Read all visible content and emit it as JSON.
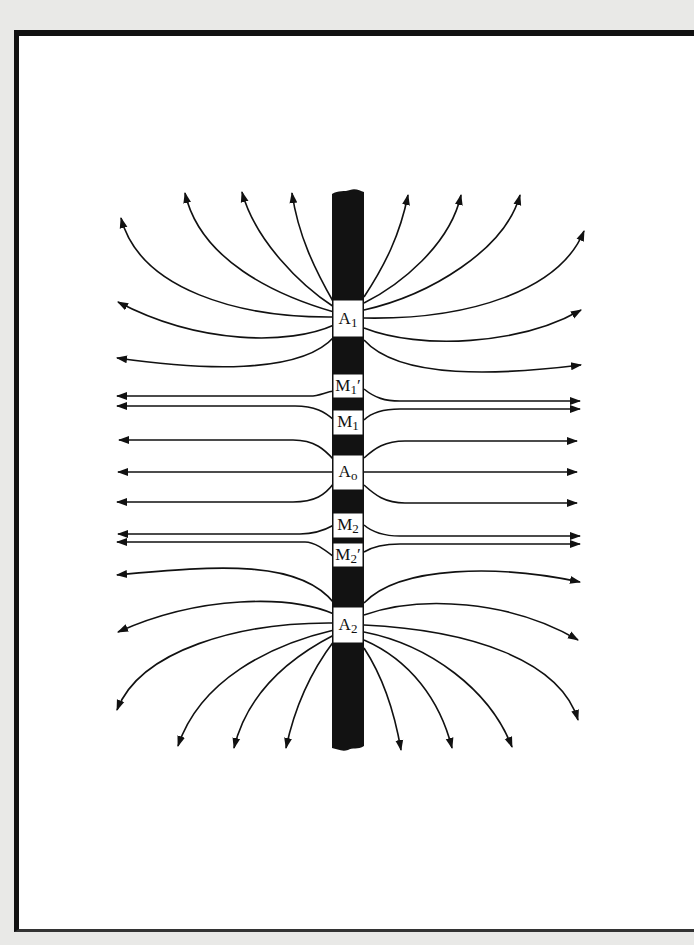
{
  "figure": {
    "colors": {
      "background": "#e9e9e7",
      "paper": "#ffffff",
      "ink": "#111111"
    }
  },
  "sonde": {
    "electrodes": [
      {
        "id": "A1",
        "main": "A",
        "sub": "1",
        "prime": "",
        "y_top": 300,
        "y_bottom": 337
      },
      {
        "id": "M1p",
        "main": "M",
        "sub": "1",
        "prime": "′",
        "y_top": 374,
        "y_bottom": 398
      },
      {
        "id": "M1",
        "main": "M",
        "sub": "1",
        "prime": "",
        "y_top": 410,
        "y_bottom": 435
      },
      {
        "id": "A0",
        "main": "A",
        "sub": "o",
        "prime": "",
        "y_top": 455,
        "y_bottom": 490
      },
      {
        "id": "M2",
        "main": "M",
        "sub": "2",
        "prime": "",
        "y_top": 513,
        "y_bottom": 538
      },
      {
        "id": "M2p",
        "main": "M",
        "sub": "2",
        "prime": "′",
        "y_top": 543,
        "y_bottom": 567
      },
      {
        "id": "A2",
        "main": "A",
        "sub": "2",
        "prime": "",
        "y_top": 607,
        "y_bottom": 643
      }
    ]
  },
  "labels": {
    "a1": {
      "main": "A",
      "sub": "1",
      "prime": ""
    },
    "m1p": {
      "main": "M",
      "sub": "1",
      "prime": "′"
    },
    "m1": {
      "main": "M",
      "sub": "1",
      "prime": ""
    },
    "a0": {
      "main": "A",
      "sub": "o",
      "prime": ""
    },
    "m2": {
      "main": "M",
      "sub": "2",
      "prime": ""
    },
    "m2p": {
      "main": "M",
      "sub": "2",
      "prime": "′"
    },
    "a2": {
      "main": "A",
      "sub": "2",
      "prime": ""
    }
  },
  "field_lines": {
    "a1_group": {
      "count_left": 6,
      "count_right": 6,
      "direction": "outward-upward"
    },
    "center_group": {
      "count_left": 7,
      "count_right": 7,
      "direction": "horizontal-outward"
    },
    "a2_group": {
      "count_left": 6,
      "count_right": 6,
      "direction": "outward-downward"
    }
  }
}
